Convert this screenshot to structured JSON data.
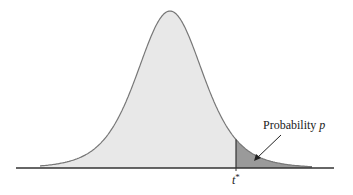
{
  "diagram": {
    "title": "",
    "type": "density curve with shaded right tail",
    "labels": {
      "critical_value": "t*",
      "critical_value_base": "t",
      "critical_value_sup": "*",
      "tail_label_text": "Probability ",
      "tail_label_var": "p"
    },
    "colors": {
      "curve_fill": "#e8e8e8",
      "tail_fill": "#9a9a9a",
      "curve_stroke": "#777777",
      "axis": "#333333"
    }
  }
}
